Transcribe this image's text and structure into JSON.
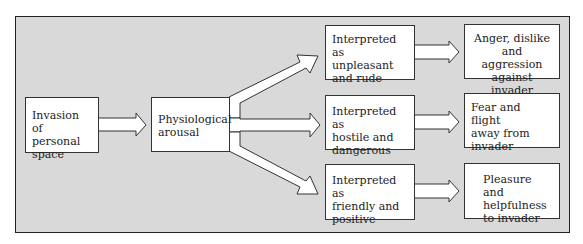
{
  "diagram": {
    "start": "Invasion\nof personal\nspace",
    "middle": "Physiological\narousal",
    "interpretations": [
      "Interpreted as\nunpleasant\nand rude",
      "Interpreted as\nhostile and\ndangerous",
      "Interpreted as\nfriendly and\npositive"
    ],
    "outcomes": [
      "Anger, dislike\nand aggression\nagainst invader",
      "Fear and flight\naway from\ninvader",
      "Pleasure and\nhelpfulness\nto invader"
    ],
    "colors": {
      "background": "#d9d9d9",
      "box": "#ffffff",
      "stroke": "#333333"
    }
  }
}
